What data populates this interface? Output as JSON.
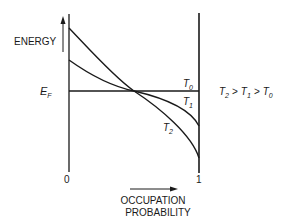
{
  "diagram": {
    "type": "fermi-dirac occupation vs energy",
    "y_axis_label": "ENERGY",
    "x_axis_label_line1": "OCCUPATION",
    "x_axis_label_line2": "PROBABILITY",
    "x_tick_left": "0",
    "x_tick_right": "1",
    "fermi_level_label": {
      "main": "E",
      "sub": "F"
    },
    "curves": [
      {
        "name": "T0",
        "main": "T",
        "sub": "0",
        "shape": "step (horizontal at E_F)"
      },
      {
        "name": "T1",
        "main": "T",
        "sub": "1",
        "shape": "moderate S-curve"
      },
      {
        "name": "T2",
        "main": "T",
        "sub": "2",
        "shape": "broad S-curve"
      }
    ],
    "relation": {
      "t2": {
        "main": "T",
        "sub": "2"
      },
      "gt1": ">",
      "t1": {
        "main": "T",
        "sub": "1"
      },
      "gt2": ">",
      "t0": {
        "main": "T",
        "sub": "0"
      }
    },
    "colors": {
      "ink": "#1a1a1a",
      "background": "#ffffff"
    }
  }
}
